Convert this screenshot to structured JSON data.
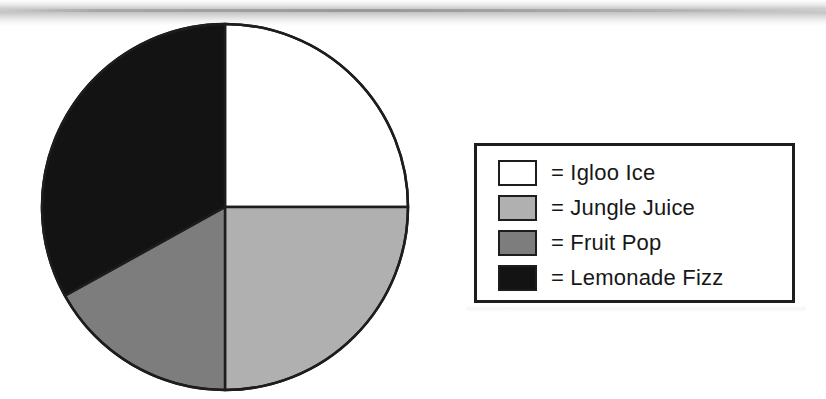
{
  "chart_data": {
    "type": "pie",
    "title": "",
    "categories": [
      "Igloo Ice",
      "Jungle Juice",
      "Fruit Pop",
      "Lemonade Fizz"
    ],
    "values": [
      25,
      25,
      17,
      33
    ],
    "units": "percent",
    "start_angle_deg": 0,
    "direction": "clockwise",
    "slices": [
      {
        "label": "Igloo Ice",
        "value": 25,
        "start_deg": 0,
        "end_deg": 90,
        "color": "#ffffff"
      },
      {
        "label": "Jungle Juice",
        "value": 25,
        "start_deg": 90,
        "end_deg": 180,
        "color": "#b0b0b0"
      },
      {
        "label": "Fruit Pop",
        "value": 17,
        "start_deg": 180,
        "end_deg": 241,
        "color": "#7d7d7d"
      },
      {
        "label": "Lemonade Fizz",
        "value": 33,
        "start_deg": 241,
        "end_deg": 360,
        "color": "#131313"
      }
    ],
    "legend_position": "right",
    "grid": false,
    "outline_color": "#1d1d1d"
  },
  "pie": {
    "center_x": 187,
    "center_y": 186,
    "radius": 183,
    "stroke_color": "#1d1d1d",
    "stroke_width": 2.5
  },
  "legend": {
    "border_color": "#1d1d1d",
    "equals_sign": "=",
    "items": [
      {
        "swatch_name": "swatch-igloo-ice",
        "color": "#ffffff",
        "label": "= Igloo Ice"
      },
      {
        "swatch_name": "swatch-jungle-juice",
        "color": "#b0b0b0",
        "label": "= Jungle Juice"
      },
      {
        "swatch_name": "swatch-fruit-pop",
        "color": "#7d7d7d",
        "label": "= Fruit Pop"
      },
      {
        "swatch_name": "swatch-lemonade-fizz",
        "color": "#131313",
        "label": "= Lemonade Fizz"
      }
    ]
  }
}
